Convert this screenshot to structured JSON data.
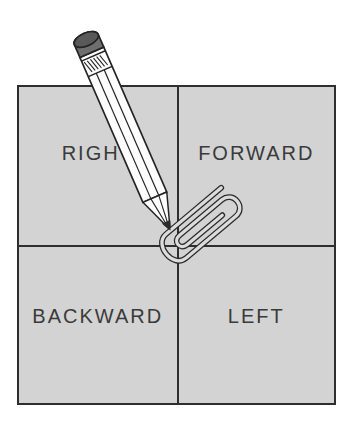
{
  "figure": {
    "type": "spinner-diagram",
    "quadrants": [
      {
        "position": "top-left",
        "label": "RIGHT"
      },
      {
        "position": "top-right",
        "label": "FORWARD"
      },
      {
        "position": "bottom-left",
        "label": "BACKWARD"
      },
      {
        "position": "bottom-right",
        "label": "LEFT"
      }
    ],
    "objects": [
      {
        "icon": "pencil-icon"
      },
      {
        "icon": "paperclip-icon"
      }
    ],
    "colors": {
      "background": "#ffffff",
      "quadrant_fill": "#d3d3d3",
      "line": "#2e2e2e",
      "label_text": "#3a3a3a",
      "pencil_body": "#ffffff",
      "eraser_side": "#6e6e6e",
      "eraser_top": "#595959",
      "graphite": "#2b2b2b",
      "paperclip_tube": "#dcdcdc"
    }
  }
}
